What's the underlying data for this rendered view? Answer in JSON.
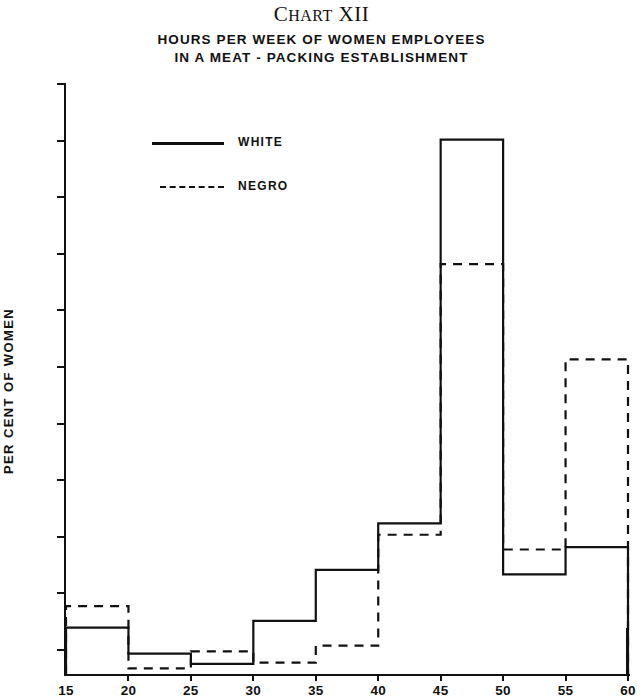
{
  "header": {
    "chart_number_prefix": "C",
    "chart_number_rest": "HART",
    "chart_number_numeral": "XII",
    "title_line_1": "HOURS PER WEEK OF WOMEN EMPLOYEES",
    "title_line_2": "IN A MEAT - PACKING ESTABLISHMENT"
  },
  "legend": {
    "white_label": "WHITE",
    "negro_label": "NEGRO"
  },
  "chart_data": {
    "type": "bar",
    "subtype": "step-histogram-outline",
    "title": "HOURS PER WEEK OF WOMEN EMPLOYEES IN A MEAT - PACKING ESTABLISHMENT",
    "chart_label": "CHART XII",
    "xlabel": "",
    "ylabel": "PER CENT OF WOMEN",
    "xlim": [
      15,
      60
    ],
    "ylim": [
      0,
      50
    ],
    "xticks": [
      15,
      20,
      25,
      30,
      35,
      40,
      45,
      50,
      55,
      60
    ],
    "yticks": [
      0,
      5,
      10,
      15,
      20,
      25,
      30,
      35,
      40,
      45,
      50
    ],
    "xtick_labels": [
      "15",
      "20",
      "25",
      "30",
      "35",
      "40",
      "45",
      "50",
      "55",
      "60"
    ],
    "ytick_labels": [
      "0",
      "5",
      "10",
      "15",
      "20",
      "25",
      "30",
      "35",
      "40",
      "45",
      "50"
    ],
    "grid": false,
    "legend_position": "upper-left-inside",
    "bin_edges": [
      15,
      20,
      25,
      30,
      35,
      40,
      45,
      50,
      55,
      60
    ],
    "categories": [
      "15-20",
      "20-25",
      "25-30",
      "30-35",
      "35-40",
      "40-45",
      "45-50",
      "50-55",
      "55-60"
    ],
    "series": [
      {
        "name": "WHITE",
        "style": "solid",
        "color": "#111111",
        "values": [
          4.1,
          1.8,
          0.9,
          4.7,
          9.2,
          13.3,
          47.2,
          8.8,
          11.2
        ]
      },
      {
        "name": "NEGRO",
        "style": "dashed",
        "color": "#111111",
        "values": [
          6.0,
          0.5,
          2.0,
          1.0,
          2.5,
          12.3,
          36.2,
          11.0,
          27.8
        ]
      }
    ]
  }
}
